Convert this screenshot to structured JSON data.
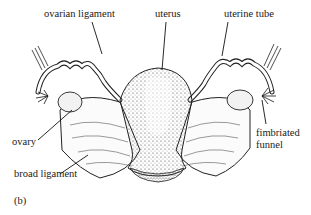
{
  "figure": {
    "panel_label": "(b)",
    "labels": {
      "ovarian_ligament": "ovarian ligament",
      "uterus": "uterus",
      "uterine_tube": "uterine tube",
      "ovary": "ovary",
      "broad_ligament": "broad ligament",
      "fimbriated_funnel_line1": "fimbriated",
      "fimbriated_funnel_line2": "funnel"
    }
  }
}
